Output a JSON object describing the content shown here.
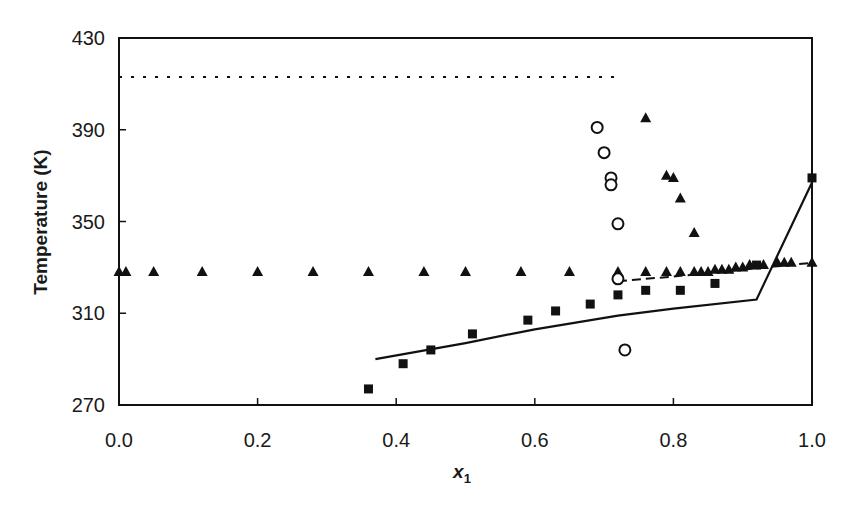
{
  "chart_data": {
    "type": "scatter",
    "title": "",
    "xlabel": "x1",
    "xlabel_main": "x",
    "xlabel_sub": "1",
    "ylabel": "Temperature (K)",
    "xlim": [
      0.0,
      1.0
    ],
    "ylim": [
      270,
      430
    ],
    "xticks": [
      0.0,
      0.2,
      0.4,
      0.6,
      0.8,
      1.0
    ],
    "xtick_labels": [
      "0.0",
      "0.2",
      "0.4",
      "0.6",
      "0.8",
      "1.0"
    ],
    "yticks": [
      270,
      310,
      350,
      390,
      430
    ],
    "ytick_labels": [
      "270",
      "310",
      "350",
      "390",
      "430"
    ],
    "grid": false,
    "legend": null,
    "series": [
      {
        "name": "filled-squares",
        "marker": "square",
        "filled": true,
        "x": [
          0.36,
          0.41,
          0.45,
          0.51,
          0.59,
          0.63,
          0.68,
          0.72,
          0.76,
          0.81,
          0.86,
          0.92,
          1.0
        ],
        "y": [
          277,
          288,
          294,
          301,
          307,
          311,
          314,
          318,
          320,
          320,
          323,
          331,
          369
        ]
      },
      {
        "name": "filled-triangles-liquidus",
        "marker": "triangle",
        "filled": true,
        "x": [
          0.0,
          0.01,
          0.05,
          0.12,
          0.2,
          0.28,
          0.36,
          0.44,
          0.5,
          0.58,
          0.65,
          0.72,
          0.76,
          0.79,
          0.81,
          0.83,
          0.84,
          0.85,
          0.86,
          0.87,
          0.88,
          0.89,
          0.9,
          0.91,
          0.93,
          0.95,
          0.96,
          0.97,
          1.0
        ],
        "y": [
          328,
          328,
          328,
          328,
          328,
          328,
          328,
          328,
          328,
          328,
          328,
          328,
          328,
          328,
          328,
          328,
          328,
          328,
          329,
          329,
          329,
          330,
          330,
          331,
          331,
          332,
          332,
          332,
          332
        ]
      },
      {
        "name": "filled-triangles-upper",
        "marker": "triangle",
        "filled": true,
        "x": [
          0.76,
          0.79,
          0.8,
          0.81,
          0.83
        ],
        "y": [
          395,
          370,
          369,
          360,
          345
        ]
      },
      {
        "name": "open-circles",
        "marker": "circle",
        "filled": false,
        "x": [
          0.69,
          0.7,
          0.71,
          0.71,
          0.72,
          0.72,
          0.73
        ],
        "y": [
          391,
          380,
          369,
          366,
          349,
          325,
          294
        ]
      },
      {
        "name": "solid-line",
        "style": "solid",
        "x": [
          0.37,
          0.5,
          0.6,
          0.72,
          0.8,
          0.92,
          1.0
        ],
        "y": [
          290,
          297,
          303,
          309,
          312,
          316,
          367
        ]
      },
      {
        "name": "dashed-line",
        "style": "dashed",
        "x": [
          0.72,
          0.8,
          0.9,
          1.0
        ],
        "y": [
          324,
          326,
          329,
          332
        ]
      },
      {
        "name": "dotted-line",
        "style": "dotted",
        "x": [
          0.0,
          0.72
        ],
        "y": [
          413,
          413
        ]
      }
    ]
  }
}
